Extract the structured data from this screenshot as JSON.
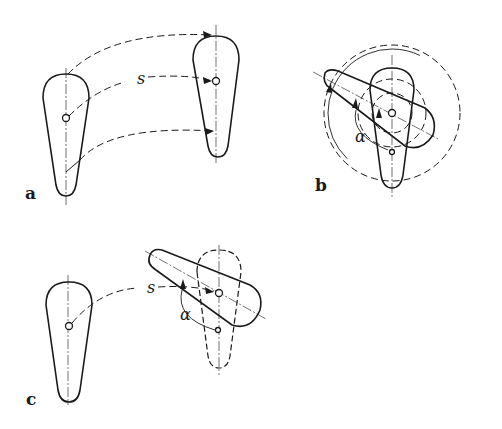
{
  "figure": {
    "panels": [
      {
        "id": "a",
        "label": "a",
        "description": "Translation of a tapered link by displacement s",
        "symbols": [
          "s"
        ]
      },
      {
        "id": "b",
        "label": "b",
        "description": "Rotation of the link about its pivot by angle α",
        "symbols": [
          "α"
        ]
      },
      {
        "id": "c",
        "label": "c",
        "description": "Combined translation s and rotation α",
        "symbols": [
          "s",
          "α"
        ]
      }
    ],
    "symbols": {
      "displacement": "s",
      "angle": "α"
    },
    "colors": {
      "line": "#1a1a1a",
      "background": "#ffffff"
    }
  }
}
